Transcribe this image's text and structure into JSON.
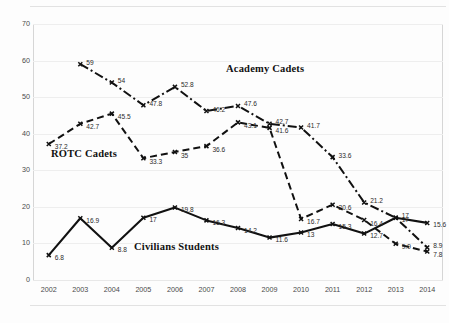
{
  "chart_data": {
    "type": "line",
    "title": "",
    "xlabel": "",
    "ylabel": "",
    "categories": [
      "2002",
      "2003",
      "2004",
      "2005",
      "2006",
      "2007",
      "2008",
      "2009",
      "2010",
      "2011",
      "2012",
      "2013",
      "2014"
    ],
    "ylim": [
      0,
      70
    ],
    "yticks": [
      "0",
      "10",
      "20",
      "30",
      "40",
      "50",
      "60",
      "70"
    ],
    "grid": true,
    "legend_position": "inline-annotations",
    "series": [
      {
        "name": "Academy Cadets",
        "style": "dash-dot",
        "color": "#111111",
        "x": [
          "2003",
          "2004",
          "2005",
          "2006",
          "2007",
          "2008",
          "2009",
          "2010",
          "2011",
          "2012",
          "2013",
          "2014"
        ],
        "values": [
          59,
          54,
          47.8,
          52.8,
          46.2,
          47.6,
          42.7,
          41.7,
          33.6,
          21.2,
          17,
          8.9
        ],
        "labels": [
          "59",
          "54",
          "47.8",
          "52.8",
          "46.2",
          "47.6",
          "42.7",
          "41.7",
          "33.6",
          "21.2",
          "17",
          "8.9"
        ]
      },
      {
        "name": "ROTC Cadets",
        "style": "dashed",
        "color": "#111111",
        "x": [
          "2002",
          "2003",
          "2004",
          "2005",
          "2006",
          "2007",
          "2008",
          "2009",
          "2010",
          "2011",
          "2012",
          "2013",
          "2014"
        ],
        "values": [
          37.2,
          42.7,
          45.5,
          33.3,
          35,
          36.6,
          43.1,
          41.6,
          16.7,
          20.6,
          16.4,
          9.9,
          7.8
        ],
        "labels": [
          "37.2",
          "42.7",
          "45.5",
          "33.3",
          "35",
          "36.6",
          "43.1",
          "41.6",
          "16.7",
          "20.6",
          "16.4",
          "9.9",
          "7.8"
        ]
      },
      {
        "name": "Civilians Students",
        "style": "solid",
        "color": "#111111",
        "x": [
          "2002",
          "2003",
          "2004",
          "2005",
          "2006",
          "2007",
          "2008",
          "2009",
          "2010",
          "2011",
          "2012",
          "2013",
          "2014"
        ],
        "values": [
          6.8,
          16.9,
          8.8,
          17,
          19.8,
          16.3,
          14.2,
          11.6,
          13,
          15.3,
          12.7,
          17,
          15.6
        ],
        "labels": [
          "6.8",
          "16.9",
          "8.8",
          "17",
          "19.8",
          "16.3",
          "14.2",
          "11.6",
          "13",
          "15.3",
          "12.7",
          "17",
          "15.6"
        ]
      }
    ]
  },
  "annotations": {
    "academy": "Academy Cadets",
    "rotc": "ROTC Cadets",
    "civilians": "Civilians Students"
  }
}
